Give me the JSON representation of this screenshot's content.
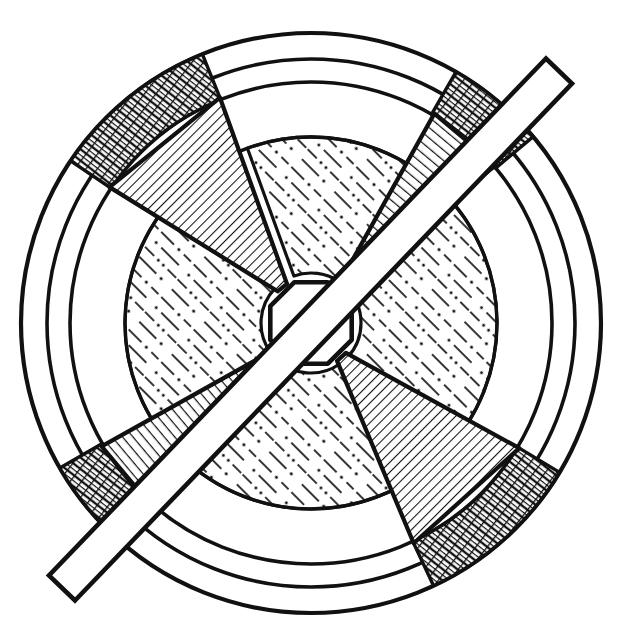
{
  "figure": {
    "background_color": "#ffffff",
    "line_color": "#111111",
    "fill_color": "#ffffff",
    "canvas": {
      "width": 622,
      "height": 637
    }
  },
  "geometry": {
    "center": {
      "x": 311,
      "y": 323
    },
    "circles": [
      {
        "name": "outer-rim-circle",
        "r": 290,
        "stroke_width": 4.2
      },
      {
        "name": "middle-rim-circle",
        "r": 264,
        "stroke_width": 3.6
      },
      {
        "name": "inner-rim-circle",
        "r": 241,
        "stroke_width": 3.6
      },
      {
        "name": "web-boundary-circle",
        "r": 186,
        "stroke_width": 3.4
      }
    ],
    "hub": {
      "name": "center-hub-octagon",
      "radius": 44,
      "sides": 8,
      "rotation_deg": 22.5,
      "stroke_width": 4.6
    },
    "spokes": [
      {
        "name": "spoke-upper-left",
        "angle_deg": 231,
        "half_width_inner_deg": 7.5,
        "half_width_outer_deg": 17.0,
        "hatch": "diagonal-dense"
      },
      {
        "name": "spoke-upper-right",
        "angle_deg": 310,
        "half_width_inner_deg": 4.0,
        "half_width_outer_deg": 9.5,
        "hatch": "cross-wise"
      },
      {
        "name": "spoke-lower-left",
        "angle_deg": 140,
        "half_width_inner_deg": 4.0,
        "half_width_outer_deg": 9.5,
        "hatch": "cross-wise"
      },
      {
        "name": "spoke-lower-right",
        "angle_deg": 48,
        "half_width_inner_deg": 7.5,
        "half_width_outer_deg": 17.0,
        "hatch": "diagonal-dense"
      }
    ],
    "rim_segments": [
      {
        "name": "rim-band-upper-left",
        "start_deg": 214,
        "end_deg": 248,
        "hatch": "brick-cross"
      },
      {
        "name": "rim-band-upper-right",
        "start_deg": 300,
        "end_deg": 320,
        "hatch": "brick-cross"
      },
      {
        "name": "rim-band-lower-left",
        "start_deg": 130,
        "end_deg": 150,
        "hatch": "brick-cross"
      },
      {
        "name": "rim-band-lower-right",
        "start_deg": 31,
        "end_deg": 65,
        "hatch": "brick-cross"
      }
    ],
    "web_sectors": [
      {
        "name": "web-sector-top",
        "start_deg": 250,
        "end_deg": 305,
        "hatch": "dash-dot-stipple"
      },
      {
        "name": "web-sector-left",
        "start_deg": 145,
        "end_deg": 224,
        "hatch": "dash-dot-stipple"
      },
      {
        "name": "web-sector-right",
        "start_deg": 315,
        "end_deg": 43,
        "hatch": "dash-dot-stipple"
      },
      {
        "name": "web-sector-bottom",
        "start_deg": 55,
        "end_deg": 135,
        "hatch": "dash-dot-stipple"
      }
    ],
    "bar": {
      "name": "diagonal-key-bar",
      "angle_deg": -46,
      "thickness": 36,
      "start": {
        "x": 62,
        "y": 588
      },
      "end": {
        "x": 559,
        "y": 71
      },
      "stroke_width": 4.6
    }
  },
  "annotations": {
    "hatch_styles": {
      "diagonal-dense": "closely spaced parallel 45-degree section lines",
      "cross-wise": "narrow ladder hatch perpendicular to spoke axis",
      "brick-cross": "staggered double cross-hatch on rim band",
      "dash-dot-stipple": "dash and dot casting texture on web panels"
    }
  }
}
